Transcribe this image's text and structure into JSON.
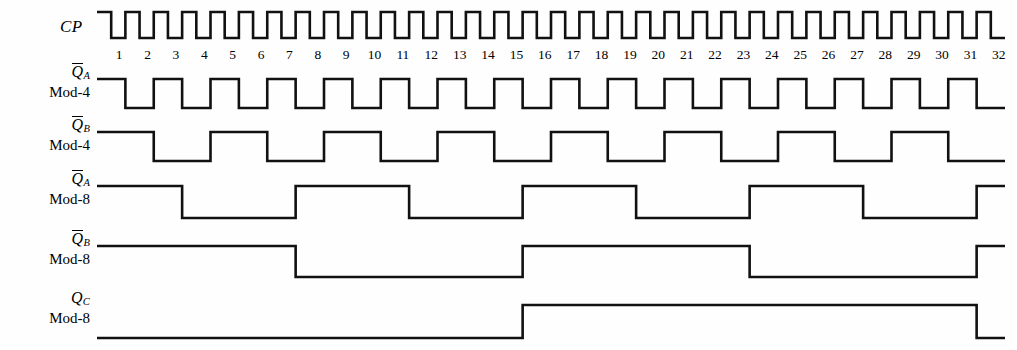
{
  "figure": {
    "kind": "digital-timing-diagram",
    "stroke_color": "#111111",
    "background": "#fefefe",
    "clock_label": "CP",
    "tick_labels": [
      "1",
      "2",
      "3",
      "4",
      "5",
      "6",
      "7",
      "8",
      "9",
      "10",
      "11",
      "12",
      "13",
      "14",
      "15",
      "16",
      "17",
      "18",
      "19",
      "20",
      "21",
      "22",
      "23",
      "24",
      "25",
      "26",
      "27",
      "28",
      "29",
      "30",
      "31",
      "32"
    ],
    "total_clock_periods": 32,
    "plot_left_px": 97,
    "plot_right_px": 1005
  },
  "rows": [
    {
      "id": "cp",
      "signal": "CP",
      "overbar": false,
      "subscript": "",
      "mod": "",
      "baseline_y": 38,
      "top_y": 12,
      "period_clocks": 1,
      "high_fraction": 0.5,
      "initial_level": "high",
      "first_high_clocks": 0.5,
      "description": "Clock: 32 pulses, 50% duty cycle"
    },
    {
      "id": "qa-mod4",
      "signal": "Q",
      "overbar": true,
      "subscript": "A",
      "mod": "Mod-4",
      "baseline_y": 108,
      "top_y": 79,
      "period_clocks": 2,
      "high_fraction": 0.5,
      "initial_level": "high",
      "first_high_clocks": 1,
      "description": "Q-bar A of Mod-4 counter: toggles every clock, period 2"
    },
    {
      "id": "qb-mod4",
      "signal": "Q",
      "overbar": true,
      "subscript": "B",
      "mod": "Mod-4",
      "baseline_y": 161,
      "top_y": 132,
      "period_clocks": 4,
      "high_fraction": 0.5,
      "initial_level": "high",
      "first_high_clocks": 2,
      "description": "Q-bar B of Mod-4 counter: period 4, 2 high / 2 low"
    },
    {
      "id": "qa-mod8",
      "signal": "Q",
      "overbar": true,
      "subscript": "A",
      "mod": "Mod-8",
      "baseline_y": 218,
      "top_y": 186,
      "period_clocks": 8,
      "high_fraction": 0.5,
      "initial_level": "high",
      "first_high_clocks": 3,
      "description": "Q-bar A of Mod-8 counter: period 8, 4 high / 4 low, first high run 3"
    },
    {
      "id": "qb-mod8",
      "signal": "Q",
      "overbar": true,
      "subscript": "B",
      "mod": "Mod-8",
      "baseline_y": 277,
      "top_y": 246,
      "period_clocks": 16,
      "high_fraction": 0.5,
      "initial_level": "high",
      "first_high_clocks": 7,
      "description": "Q-bar B of Mod-8 counter: period 16, 8 high / 8 low, first high run 7"
    },
    {
      "id": "qc-mod8",
      "signal": "Q",
      "overbar": false,
      "subscript": "C",
      "mod": "Mod-8",
      "baseline_y": 338,
      "top_y": 305,
      "period_clocks": 32,
      "high_fraction": 0.5,
      "initial_level": "low",
      "first_high_clocks": 0,
      "first_low_clocks": 15,
      "description": "Q C of Mod-8 counter: low 15 clocks, high 16 clocks, then low"
    }
  ]
}
